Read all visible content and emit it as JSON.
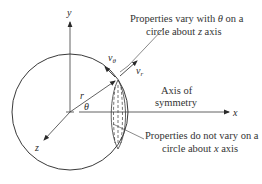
{
  "diagram": {
    "axes": {
      "x_label": "x",
      "y_label": "y",
      "z_label": "z"
    },
    "symbols": {
      "radius": "r",
      "angle": "θ",
      "v_theta": "v",
      "v_theta_sub": "θ",
      "v_r": "v",
      "v_r_sub": "r"
    },
    "annotations": {
      "top_line1": "Properties vary with",
      "top_theta": "θ",
      "top_line1_end": "on a",
      "top_line2_pre": "circle about",
      "top_line2_axis": "z",
      "top_line2_post": "axis",
      "axis_line1": "Axis of",
      "axis_line2": "symmetry",
      "bottom_line1": "Properties do not vary on a",
      "bottom_line2_pre": "circle about",
      "bottom_line2_axis": "x",
      "bottom_line2_post": "axis"
    },
    "colors": {
      "stroke": "#3a3a3a",
      "text": "#333333",
      "background": "#ffffff"
    }
  }
}
